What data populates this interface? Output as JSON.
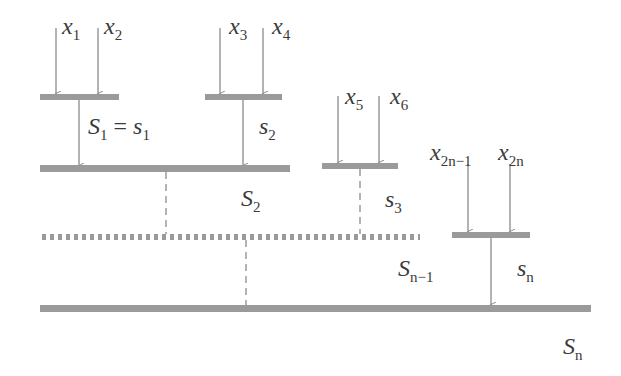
{
  "diagram": {
    "inputs": [
      {
        "var": "x",
        "sub": "1"
      },
      {
        "var": "x",
        "sub": "2"
      },
      {
        "var": "x",
        "sub": "3"
      },
      {
        "var": "x",
        "sub": "4"
      },
      {
        "var": "x",
        "sub": "5"
      },
      {
        "var": "x",
        "sub": "6"
      },
      {
        "var": "x",
        "sub": "2n−1"
      },
      {
        "var": "x",
        "sub": "2n"
      }
    ],
    "partial_sums": [
      {
        "var": "s",
        "sub": "2"
      },
      {
        "var": "s",
        "sub": "3"
      },
      {
        "var": "s",
        "sub": "n"
      }
    ],
    "first_equation": {
      "lhs_var": "S",
      "lhs_sub": "1",
      "eq": " = ",
      "rhs_var": "s",
      "rhs_sub": "1"
    },
    "cumulative_sums": [
      {
        "var": "S",
        "sub": "2"
      },
      {
        "var": "S",
        "sub": "n−1"
      },
      {
        "var": "S",
        "sub": "n"
      }
    ],
    "colors": {
      "bar": "#9a9a9a",
      "arrow": "#8a8a8a",
      "text": "#3a3a3a"
    }
  }
}
